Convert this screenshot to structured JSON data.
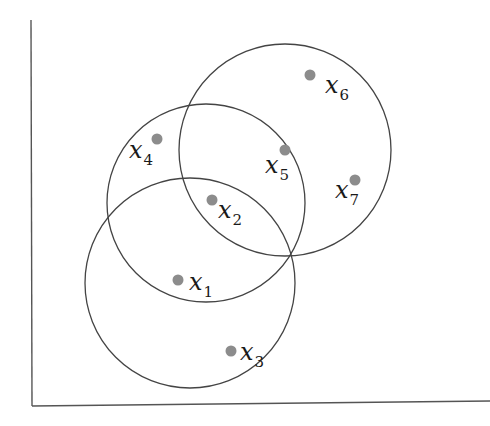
{
  "diagram": {
    "type": "overlapping-circles-clustering",
    "colors": {
      "axis": "#555555",
      "circle": "#444444",
      "point": "#8c8c8c",
      "label": "#1a1a1a"
    },
    "axes": {
      "y_axis": {
        "x1": 31,
        "y1": 20,
        "x2": 32,
        "y2": 406
      },
      "x_axis": {
        "x1": 32,
        "y1": 406,
        "x2": 490,
        "y2": 401
      }
    },
    "circles": [
      {
        "id": "circle-bottom",
        "cx": 190,
        "cy": 283,
        "r": 105
      },
      {
        "id": "circle-middle",
        "cx": 206,
        "cy": 203,
        "r": 99
      },
      {
        "id": "circle-top-right",
        "cx": 285,
        "cy": 150,
        "r": 106
      }
    ],
    "points": [
      {
        "name": "x",
        "sub": "1",
        "cx": 178,
        "cy": 280,
        "lx": 189,
        "ly": 290
      },
      {
        "name": "x",
        "sub": "2",
        "cx": 212,
        "cy": 200,
        "lx": 218,
        "ly": 218
      },
      {
        "name": "x",
        "sub": "3",
        "cx": 231,
        "cy": 351,
        "lx": 240,
        "ly": 360
      },
      {
        "name": "x",
        "sub": "4",
        "cx": 157,
        "cy": 139,
        "lx": 129,
        "ly": 158
      },
      {
        "name": "x",
        "sub": "5",
        "cx": 285,
        "cy": 150,
        "lx": 265,
        "ly": 173
      },
      {
        "name": "x",
        "sub": "6",
        "cx": 310,
        "cy": 75,
        "lx": 325,
        "ly": 93
      },
      {
        "name": "x",
        "sub": "7",
        "cx": 355,
        "cy": 180,
        "lx": 335,
        "ly": 198
      }
    ]
  }
}
